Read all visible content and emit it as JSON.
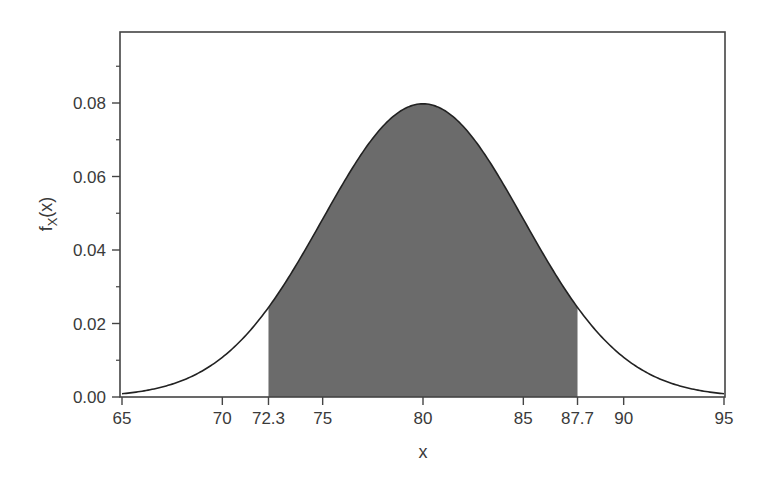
{
  "chart_data": {
    "type": "area",
    "title": "",
    "xlabel": "x",
    "ylabel": "f_X(x)",
    "ylabel_main": "f",
    "ylabel_sub": "X",
    "ylabel_tail": "(x)",
    "distribution": {
      "name": "normal",
      "mean": 80,
      "sd": 5
    },
    "xlim": [
      65,
      95
    ],
    "ylim": [
      0,
      0.1
    ],
    "x_ticks": [
      65,
      70,
      72.3,
      75,
      80,
      85,
      87.7,
      90,
      95
    ],
    "x_tick_labels": [
      "65",
      "70",
      "72.3",
      "75",
      "80",
      "85",
      "87.7",
      "90",
      "95"
    ],
    "y_ticks": [
      0.0,
      0.02,
      0.04,
      0.06,
      0.08
    ],
    "y_tick_labels": [
      "0.00",
      "0.02",
      "0.04",
      "0.06",
      "0.08"
    ],
    "y_minor_ticks": [
      0.01,
      0.03,
      0.05,
      0.07,
      0.09
    ],
    "shaded_region": {
      "from": 72.3,
      "to": 87.7,
      "color": "#6b6b6b"
    },
    "series": [
      {
        "name": "density",
        "x": [
          65,
          67.5,
          70,
          72.3,
          75,
          77.5,
          80,
          82.5,
          85,
          87.7,
          90,
          92.5,
          95
        ],
        "values": [
          0.0009,
          0.0035,
          0.0108,
          0.0244,
          0.0484,
          0.0704,
          0.0798,
          0.0704,
          0.0484,
          0.0244,
          0.0108,
          0.0035,
          0.0009
        ]
      }
    ],
    "grid": false,
    "legend": null,
    "colors": {
      "curve": "#222222",
      "fill": "#6b6b6b",
      "frame": "#444444"
    }
  }
}
